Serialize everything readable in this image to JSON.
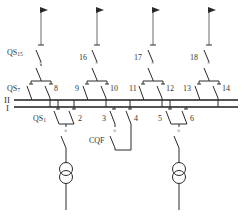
{
  "diagram": {
    "type": "single-line electrical diagram (double busbar)",
    "colors": {
      "line": "#2a2a2a",
      "feeder_line": "#6a6a6a",
      "text": "#333333",
      "background": "#ffffff"
    },
    "busbars": [
      {
        "id": "bus-II",
        "label": "II"
      },
      {
        "id": "bus-I",
        "label": "I"
      }
    ],
    "feeders": [
      {
        "line_disconnector": "QS15",
        "label_main": "QS",
        "label_sub": "15",
        "bus_II_disconnector": "QS7",
        "bus_II_main": "QS",
        "bus_II_sub": "7",
        "bus_I_disconnector": "8"
      },
      {
        "line_disconnector": "16",
        "bus_II_disconnector": "9",
        "bus_I_disconnector": "10"
      },
      {
        "line_disconnector": "17",
        "bus_II_disconnector": "11",
        "bus_I_disconnector": "12"
      },
      {
        "line_disconnector": "18",
        "bus_II_disconnector": "13",
        "bus_I_disconnector": "14"
      }
    ],
    "sources": [
      {
        "type": "transformer",
        "bus_I_disconnector_main": "QS",
        "bus_I_disconnector_sub": "1",
        "bus_II_disconnector": "2"
      },
      {
        "type": "transformer",
        "bus_I_disconnector": "5",
        "bus_II_disconnector": "6"
      }
    ],
    "coupler": {
      "breaker": "CQF",
      "disconnector_a": "3",
      "disconnector_b": "4"
    }
  }
}
